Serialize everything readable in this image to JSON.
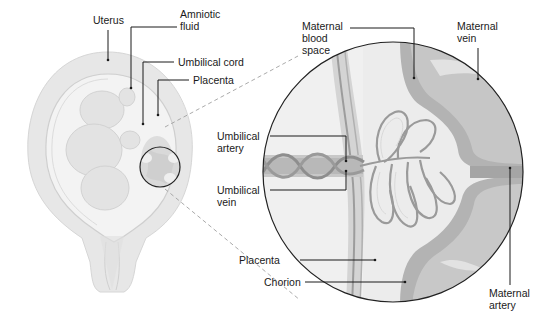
{
  "figure": {
    "overview": {
      "labels": {
        "uterus": "Uterus",
        "amniotic_fluid": "Amniotic\nfluid",
        "umbilical_cord": "Umbilical cord",
        "placenta": "Placenta"
      }
    },
    "detail": {
      "labels": {
        "maternal_blood_space": "Maternal\nblood\nspace",
        "maternal_vein": "Maternal\nvein",
        "umbilical_artery": "Umbilical\nartery",
        "umbilical_vein": "Umbilical\nvein",
        "placenta": "Placenta",
        "chorion": "Chorion",
        "maternal_artery": "Maternal\nartery"
      }
    },
    "colors": {
      "background": "#ffffff",
      "uterus_wall": "#e6e6e6",
      "amniotic_cavity": "#f2f2f2",
      "fetus": "#e4e4e4",
      "detail_background": "#ececec",
      "maternal_blood": "#a9a9a9",
      "vessel": "#9a9a9a",
      "outline": "#222222",
      "leader_line": "#1a1a1a",
      "dashed_line": "#9a9a9a"
    }
  }
}
